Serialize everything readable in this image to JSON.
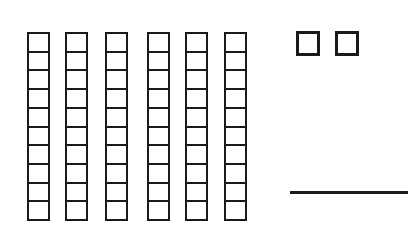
{
  "figure": {
    "tens": {
      "count": 6,
      "cells_per_rod": 10,
      "rod_left_positions": [
        27,
        65,
        105,
        147,
        185,
        224
      ]
    },
    "ones": {
      "count": 2,
      "cube_left_positions": [
        296,
        335
      ]
    },
    "answer_line": {
      "value": ""
    },
    "colors": {
      "stroke": "#1a1a1a",
      "background": "#ffffff"
    }
  }
}
